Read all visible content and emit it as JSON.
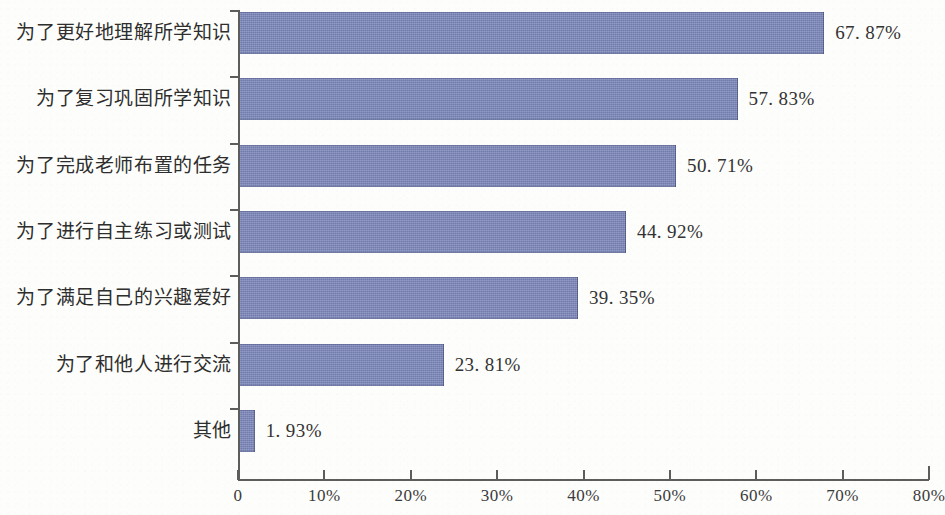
{
  "chart_data": {
    "type": "bar",
    "orientation": "horizontal",
    "title": "",
    "subtitle": "",
    "xlabel": "",
    "ylabel": "",
    "xlim": [
      0,
      80
    ],
    "grid": false,
    "legend": null,
    "bar_color": "#7b86b8",
    "axis_color": "#5d5d5d",
    "background_color": "#fdfdfb",
    "categories": [
      "为了更好地理解所学知识",
      "为了复习巩固所学知识",
      "为了完成老师布置的任务",
      "为了进行自主练习或测试",
      "为了满足自己的兴趣爱好",
      "为了和他人进行交流",
      "其他"
    ],
    "values": [
      67.87,
      57.83,
      50.71,
      44.92,
      39.35,
      23.81,
      1.93
    ],
    "value_labels": [
      "67. 87%",
      "57. 83%",
      "50. 71%",
      "44. 92%",
      "39. 35%",
      "23. 81%",
      "1. 93%"
    ],
    "xticks": [
      0,
      10,
      20,
      30,
      40,
      50,
      60,
      70,
      80
    ],
    "xtick_labels": [
      "0",
      "10%",
      "20%",
      "30%",
      "40%",
      "50%",
      "60%",
      "70%",
      "80%"
    ]
  }
}
